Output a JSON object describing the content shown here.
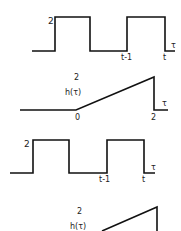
{
  "diagram": {
    "colors": {
      "stroke": "#111111",
      "text": "#222222",
      "background": "#ffffff"
    },
    "panels": [
      {
        "id": "pulse-train-1",
        "points": "32,51 55,51 55,17 90,17 90,51 127,51 127,17 165,17 165,51 175,51",
        "labels": [
          {
            "text": "2",
            "x": 48,
            "y": 24,
            "name": "amplitude-label"
          },
          {
            "text": "t-1",
            "x": 121,
            "y": 60,
            "name": "t-minus-1-label"
          },
          {
            "text": "t",
            "x": 163,
            "y": 60,
            "name": "t-label"
          },
          {
            "text": "τ",
            "x": 171,
            "y": 48,
            "name": "tau-axis-label"
          }
        ]
      },
      {
        "id": "impulse-response-1",
        "points": "20,110 76,110 154,77 154,110 168,110",
        "labels": [
          {
            "text": "2",
            "x": 74,
            "y": 80,
            "name": "amplitude-label"
          },
          {
            "text": "h(τ)",
            "x": 65,
            "y": 95,
            "name": "h-tau-label"
          },
          {
            "text": "0",
            "x": 75,
            "y": 120,
            "name": "zero-label"
          },
          {
            "text": "2",
            "x": 151,
            "y": 120,
            "name": "two-label"
          },
          {
            "text": "τ",
            "x": 162,
            "y": 106,
            "name": "tau-axis-label"
          }
        ]
      },
      {
        "id": "pulse-train-2",
        "points": "10,173 33,173 33,140 69,140 69,173 107,173 107,140 144,140 144,173 155,173",
        "labels": [
          {
            "text": "2",
            "x": 24,
            "y": 147,
            "name": "amplitude-label"
          },
          {
            "text": "t-1",
            "x": 99,
            "y": 182,
            "name": "t-minus-1-label"
          },
          {
            "text": "t",
            "x": 142,
            "y": 182,
            "name": "t-label"
          },
          {
            "text": "τ",
            "x": 151,
            "y": 170,
            "name": "tau-axis-label"
          }
        ]
      },
      {
        "id": "impulse-response-2",
        "points": "102,231 157,207 157,231",
        "labels": [
          {
            "text": "2",
            "x": 77,
            "y": 214,
            "name": "amplitude-label"
          },
          {
            "text": "h(τ)",
            "x": 70,
            "y": 229,
            "name": "h-tau-label"
          }
        ]
      }
    ]
  }
}
